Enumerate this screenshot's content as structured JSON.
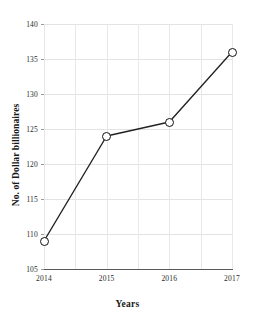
{
  "chart_data": {
    "type": "line",
    "title": "",
    "xlabel": "Years",
    "ylabel": "No. of Dollar billionaires",
    "categories": [
      "2014",
      "2015",
      "2016",
      "2017"
    ],
    "x": [
      2014,
      2015,
      2016,
      2017
    ],
    "values": [
      109,
      124,
      126,
      136
    ],
    "series": [
      {
        "name": "No. of Dollar billionaires",
        "values": [
          109,
          124,
          126,
          136
        ]
      }
    ],
    "ylim": [
      105,
      140
    ],
    "xlim": [
      2014,
      2017
    ],
    "yticks": [
      105,
      110,
      115,
      120,
      125,
      130,
      135,
      140
    ],
    "ytick_labels": [
      "105",
      "110",
      "115",
      "120",
      "125",
      "130",
      "135",
      "140"
    ],
    "xticks": [
      2014,
      2015,
      2016,
      2017
    ],
    "xtick_labels": [
      "2014",
      "2015",
      "2016",
      "2017"
    ],
    "grid": true,
    "grid_vertical_count": 6,
    "legend": null,
    "marker": "open-circle",
    "line_color": "#222222",
    "marker_edge_color": "#111111",
    "marker_face_color": "#ffffff",
    "grid_color": "#e4e4e7",
    "background": "#ffffff"
  }
}
